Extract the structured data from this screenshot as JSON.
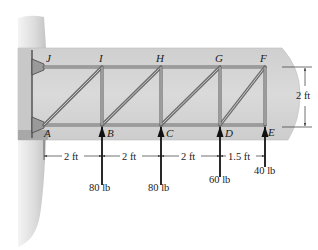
{
  "diagram": {
    "type": "truss",
    "nodes": {
      "top": [
        "J",
        "I",
        "H",
        "G",
        "F"
      ],
      "bottom": [
        "A",
        "B",
        "C",
        "D",
        "E"
      ]
    },
    "dimensions": {
      "horizontal": [
        "2 ft",
        "2 ft",
        "2 ft",
        "1.5 ft"
      ],
      "vertical": "2 ft"
    },
    "loads": [
      {
        "node": "B",
        "label": "80 lb",
        "direction": "up"
      },
      {
        "node": "C",
        "label": "80 lb",
        "direction": "up"
      },
      {
        "node": "D",
        "label": "60 lb",
        "direction": "up"
      },
      {
        "node": "E",
        "label": "40 lb",
        "direction": "up"
      }
    ],
    "colors": {
      "panel": "#d9d9d9",
      "member": "#6e6e6e",
      "fuselage": "#e2e2e2"
    }
  }
}
